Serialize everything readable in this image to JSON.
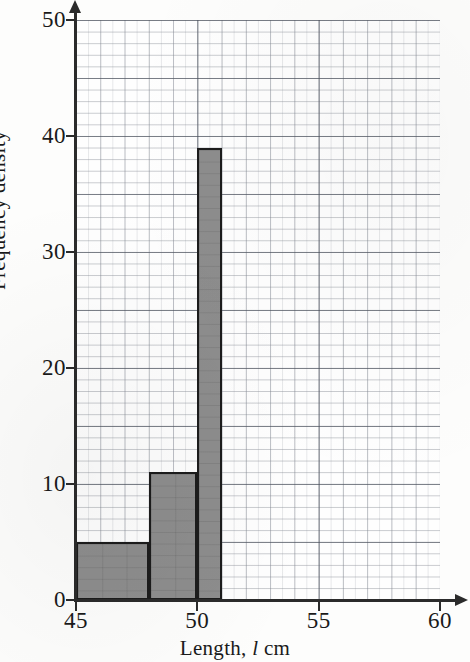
{
  "chart_data": {
    "type": "bar",
    "title": "",
    "subtitle": "",
    "xlabel_prefix": "Length,",
    "xlabel_variable": "l",
    "xlabel_suffix": "cm",
    "xlabel": "Length, l cm",
    "ylabel": "Frequency density",
    "xlim": [
      45,
      60
    ],
    "ylim": [
      0,
      50
    ],
    "xticks": [
      45,
      50,
      55,
      60
    ],
    "yticks": [
      0,
      10,
      20,
      30,
      40,
      50
    ],
    "xtick_labels": [
      "45",
      "50",
      "55",
      "60"
    ],
    "ytick_labels": [
      "0",
      "10",
      "20",
      "30",
      "40",
      "50"
    ],
    "grid": true,
    "grid_minor_x_step": 1,
    "grid_minor_y_step": 1,
    "grid_major_x_step": 5,
    "grid_major_y_step": 5,
    "legend": false,
    "bar_fill_color": "#8d8d8d",
    "bar_edge_color": "#1c1c1c",
    "axis_color": "#2b2b2b",
    "bins": [
      {
        "label": "45-48",
        "x_start": 45,
        "x_end": 48,
        "frequency_density": 5
      },
      {
        "label": "48-50",
        "x_start": 48,
        "x_end": 50,
        "frequency_density": 11
      },
      {
        "label": "50-51",
        "x_start": 50,
        "x_end": 51,
        "frequency_density": 39
      }
    ],
    "categories": [
      "45-48",
      "48-50",
      "50-51"
    ],
    "values": [
      5,
      11,
      39
    ]
  }
}
